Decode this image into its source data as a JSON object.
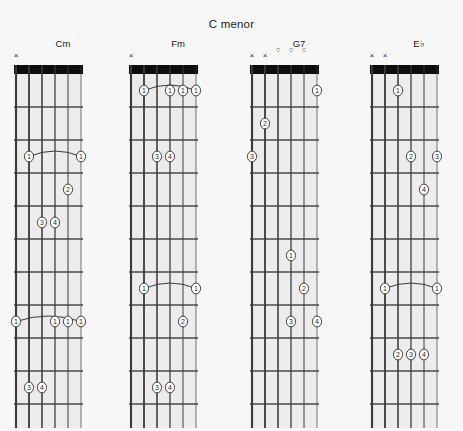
{
  "page": {
    "title": "C menor",
    "background_color": "#f7f7f7",
    "ink_color": "#2a2a2a",
    "nut_color": "#0d0d0d"
  },
  "diagram_geometry": {
    "strings": 6,
    "frets_shown": 11,
    "string_spacing_px": 13,
    "fret_spacing_px": 33,
    "board_left_px": 8,
    "board_top_px": 10,
    "nut_height_px": 9
  },
  "chords": [
    {
      "name": "Cm",
      "left_px": 8,
      "markers": [
        {
          "string": 6,
          "symbol": "×",
          "type": "muted"
        }
      ],
      "barres": [
        {
          "fret": 3,
          "from_string": 5,
          "to_string": 1,
          "finger": "1"
        },
        {
          "fret": 8,
          "from_string": 6,
          "to_string": 1,
          "finger": "1"
        }
      ],
      "dots": [
        {
          "fret": 3,
          "string": 5,
          "finger": "1"
        },
        {
          "fret": 3,
          "string": 1,
          "finger": "1"
        },
        {
          "fret": 4,
          "string": 2,
          "finger": "2"
        },
        {
          "fret": 5,
          "string": 4,
          "finger": "3"
        },
        {
          "fret": 5,
          "string": 3,
          "finger": "4"
        },
        {
          "fret": 8,
          "string": 6,
          "finger": "1"
        },
        {
          "fret": 8,
          "string": 3,
          "finger": "1"
        },
        {
          "fret": 8,
          "string": 2,
          "finger": "1"
        },
        {
          "fret": 8,
          "string": 1,
          "finger": "1"
        },
        {
          "fret": 10,
          "string": 5,
          "finger": "3"
        },
        {
          "fret": 10,
          "string": 4,
          "finger": "4"
        }
      ]
    },
    {
      "name": "Fm",
      "left_px": 123,
      "markers": [
        {
          "string": 6,
          "symbol": "×",
          "type": "muted"
        }
      ],
      "barres": [
        {
          "fret": 1,
          "from_string": 5,
          "to_string": 1,
          "finger": "1"
        },
        {
          "fret": 7,
          "from_string": 5,
          "to_string": 1,
          "finger": "1"
        }
      ],
      "dots": [
        {
          "fret": 1,
          "string": 5,
          "finger": "1"
        },
        {
          "fret": 1,
          "string": 3,
          "finger": "1"
        },
        {
          "fret": 1,
          "string": 2,
          "finger": "1"
        },
        {
          "fret": 1,
          "string": 1,
          "finger": "1"
        },
        {
          "fret": 3,
          "string": 4,
          "finger": "3"
        },
        {
          "fret": 3,
          "string": 3,
          "finger": "4"
        },
        {
          "fret": 7,
          "string": 5,
          "finger": "1"
        },
        {
          "fret": 7,
          "string": 1,
          "finger": "1"
        },
        {
          "fret": 8,
          "string": 2,
          "finger": "2"
        },
        {
          "fret": 10,
          "string": 4,
          "finger": "3"
        },
        {
          "fret": 10,
          "string": 3,
          "finger": "4"
        }
      ]
    },
    {
      "name": "G7",
      "left_px": 244,
      "markers": [
        {
          "string": 6,
          "symbol": "×",
          "type": "muted"
        },
        {
          "string": 5,
          "symbol": "×",
          "type": "muted"
        },
        {
          "string": 4,
          "symbol": "○",
          "type": "open"
        },
        {
          "string": 3,
          "symbol": "○",
          "type": "open"
        },
        {
          "string": 2,
          "symbol": "○",
          "type": "open"
        }
      ],
      "barres": [],
      "dots": [
        {
          "fret": 1,
          "string": 1,
          "finger": "1"
        },
        {
          "fret": 2,
          "string": 5,
          "finger": "2"
        },
        {
          "fret": 3,
          "string": 6,
          "finger": "3"
        },
        {
          "fret": 6,
          "string": 3,
          "finger": "1"
        },
        {
          "fret": 7,
          "string": 2,
          "finger": "2"
        },
        {
          "fret": 8,
          "string": 3,
          "finger": "3"
        },
        {
          "fret": 8,
          "string": 1,
          "finger": "4"
        }
      ]
    },
    {
      "name": "E♭",
      "left_px": 364,
      "markers": [
        {
          "string": 6,
          "symbol": "×",
          "type": "muted"
        },
        {
          "string": 5,
          "symbol": "×",
          "type": "muted"
        }
      ],
      "barres": [
        {
          "fret": 7,
          "from_string": 5,
          "to_string": 1,
          "finger": "1"
        }
      ],
      "dots": [
        {
          "fret": 1,
          "string": 4,
          "finger": "1"
        },
        {
          "fret": 3,
          "string": 3,
          "finger": "2"
        },
        {
          "fret": 3,
          "string": 1,
          "finger": "3"
        },
        {
          "fret": 4,
          "string": 2,
          "finger": "4"
        },
        {
          "fret": 7,
          "string": 5,
          "finger": "1"
        },
        {
          "fret": 7,
          "string": 1,
          "finger": "1"
        },
        {
          "fret": 9,
          "string": 4,
          "finger": "2"
        },
        {
          "fret": 9,
          "string": 3,
          "finger": "3"
        },
        {
          "fret": 9,
          "string": 2,
          "finger": "4"
        }
      ]
    }
  ]
}
